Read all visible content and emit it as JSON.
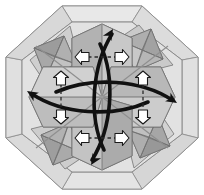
{
  "figure": {
    "shape_name": "octagon",
    "symmetry": "4-fold rotational",
    "background_color": "#ffffff"
  },
  "palette": {
    "paper_light": "#e3e3e3",
    "paper_lighter": "#ebebeb",
    "paper_mid": "#cfcfcf",
    "paper_mid2": "#c4c4c4",
    "paper_dark": "#a8a8a8",
    "paper_darker": "#9a9a9a",
    "paper_shadow": "#8e8e8e",
    "outline": "#6b6b6b",
    "outline_soft": "#8a8a8a",
    "arrow_black": "#111111",
    "arrow_white_fill": "#ffffff",
    "arrow_white_stroke": "#1a1a1a",
    "dash_color": "#2b2b2b"
  },
  "geometry": {
    "center_x": 102,
    "center_y": 97,
    "octagon_radius": 96
  },
  "outer_octagon": {
    "label": "outer octagon boundary",
    "points": "62,6 142,6 198,57 198,138 142,189 62,189 6,138 6,57",
    "fill": "#ebebeb",
    "stroke": "#7a7a7a"
  },
  "inner_octagon": {
    "label": "inner octagon crease",
    "points": "72,22 132,22 182,60 182,134 132,172 72,172 22,134 22,60",
    "fill": "#e3e3e3",
    "stroke": "#8a8a8a"
  },
  "petals": [
    {
      "name": "petal-north",
      "rotation": 0,
      "fill": "#bdbdbd"
    },
    {
      "name": "petal-east",
      "rotation": 90,
      "fill": "#c4c4c4"
    },
    {
      "name": "petal-south",
      "rotation": 180,
      "fill": "#b5b5b5"
    },
    {
      "name": "petal-west",
      "rotation": 270,
      "fill": "#c9c9c9"
    }
  ],
  "corner_diamonds": [
    {
      "name": "corner-diamond-nw",
      "rotation": 0,
      "fill_light": "#d2d2d2",
      "fill_dark": "#9c9c9c"
    },
    {
      "name": "corner-diamond-ne",
      "rotation": 90,
      "fill_light": "#cccccc",
      "fill_dark": "#a2a2a2"
    },
    {
      "name": "corner-diamond-se",
      "rotation": 180,
      "fill_light": "#d4d4d4",
      "fill_dark": "#989898"
    },
    {
      "name": "corner-diamond-sw",
      "rotation": 270,
      "fill_light": "#cfcfcf",
      "fill_dark": "#9e9e9e"
    }
  ],
  "black_curved_arrows": [
    {
      "name": "curved-arrow-north",
      "direction": "up",
      "path": "M 104 150 C 88 116 92 66 112 34",
      "head_angle": -58
    },
    {
      "name": "curved-arrow-east",
      "direction": "right",
      "path": "M 56 92 C 92 76 142 80 172 100",
      "head_angle": 32
    },
    {
      "name": "curved-arrow-south",
      "direction": "down",
      "path": "M 100 44 C 116 78 112 128 92 160",
      "head_angle": 122
    },
    {
      "name": "curved-arrow-west",
      "direction": "left",
      "path": "M 148 102 C 112 118 62 114 32 94",
      "head_angle": 212
    }
  ],
  "white_arrow_pairs": [
    {
      "name": "white-arrow-pair-top",
      "orientation": "horizontal",
      "dash_line": {
        "x1": 88,
        "y1": 57,
        "x2": 116,
        "y2": 57
      },
      "arrows": [
        {
          "name": "white-arrow-top-left",
          "x": 83,
          "y": 57,
          "direction": "left"
        },
        {
          "name": "white-arrow-top-right",
          "x": 121,
          "y": 57,
          "direction": "right"
        }
      ]
    },
    {
      "name": "white-arrow-pair-bottom",
      "orientation": "horizontal",
      "dash_line": {
        "x1": 88,
        "y1": 138,
        "x2": 116,
        "y2": 138
      },
      "arrows": [
        {
          "name": "white-arrow-bottom-left",
          "x": 83,
          "y": 138,
          "direction": "left"
        },
        {
          "name": "white-arrow-bottom-right",
          "x": 121,
          "y": 138,
          "direction": "right"
        }
      ]
    },
    {
      "name": "white-arrow-pair-left",
      "orientation": "vertical",
      "dash_line": {
        "x1": 61,
        "y1": 84,
        "x2": 61,
        "y2": 111
      },
      "arrows": [
        {
          "name": "white-arrow-left-top",
          "x": 61,
          "y": 79,
          "direction": "up"
        },
        {
          "name": "white-arrow-left-bottom",
          "x": 61,
          "y": 116,
          "direction": "down"
        }
      ]
    },
    {
      "name": "white-arrow-pair-right",
      "orientation": "vertical",
      "dash_line": {
        "x1": 143,
        "y1": 84,
        "x2": 143,
        "y2": 111
      },
      "arrows": [
        {
          "name": "white-arrow-right-top",
          "x": 143,
          "y": 79,
          "direction": "up"
        },
        {
          "name": "white-arrow-right-bottom",
          "x": 143,
          "y": 116,
          "direction": "down"
        }
      ]
    }
  ],
  "center_creases": {
    "name": "center-radiating-creases",
    "count": 8,
    "stroke": "#8f8f8f"
  }
}
